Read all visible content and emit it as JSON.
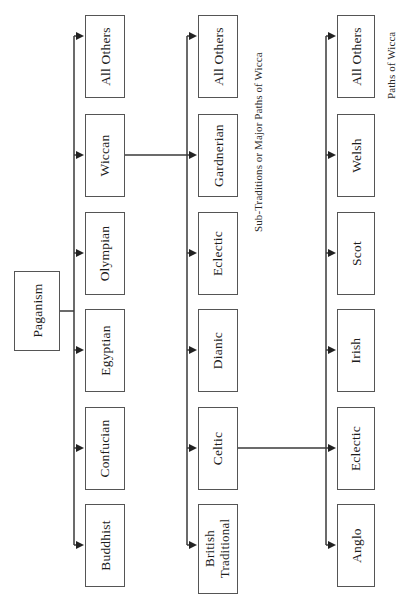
{
  "diagram": {
    "orientation": "rotated-90-sideways",
    "root": {
      "label": "Paganism"
    },
    "columns": [
      {
        "id": "religions",
        "caption": "",
        "items": [
          {
            "label": "All Others"
          },
          {
            "label": "Wiccan"
          },
          {
            "label": "Olympian"
          },
          {
            "label": "Egyptian"
          },
          {
            "label": "Confucian"
          },
          {
            "label": "Buddhist"
          }
        ]
      },
      {
        "id": "sub-traditions",
        "caption": "Sub-Traditions or Major Paths of Wicca",
        "items": [
          {
            "label": "All Others"
          },
          {
            "label": "Gardnerian"
          },
          {
            "label": "Eclectic"
          },
          {
            "label": "Dianic"
          },
          {
            "label": "Celtic"
          },
          {
            "label": "British Traditional"
          }
        ]
      },
      {
        "id": "paths",
        "caption": "Paths of Wicca",
        "items": [
          {
            "label": "All Others"
          },
          {
            "label": "Welsh"
          },
          {
            "label": "Scot"
          },
          {
            "label": "Irish"
          },
          {
            "label": "Eclectic"
          },
          {
            "label": "Anglo"
          }
        ]
      }
    ],
    "links": [
      {
        "from": "Paganism",
        "to": "religions-bus"
      },
      {
        "from": "Wiccan",
        "to": "sub-traditions-bus"
      },
      {
        "from": "Celtic",
        "to": "Eclectic"
      }
    ],
    "colors": {
      "box_border": "#555555",
      "line": "#3a3a3a",
      "text": "#1c1c1c",
      "background": "#ffffff"
    }
  }
}
